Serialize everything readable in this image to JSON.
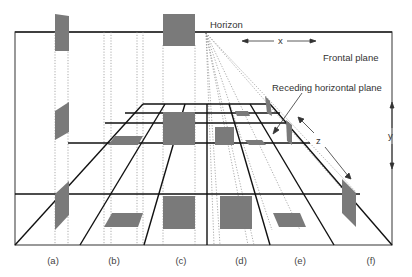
{
  "diagram": {
    "labels": {
      "horizon": "Horizon",
      "frontal_plane": "Frontal plane",
      "receding_plane": "Receding horizontal plane",
      "x_axis": "x",
      "y_axis": "y",
      "z_axis": "z"
    },
    "captions": [
      {
        "id": "a",
        "text": "(a)"
      },
      {
        "id": "b",
        "text": "(b)"
      },
      {
        "id": "c",
        "text": "(c)"
      },
      {
        "id": "d",
        "text": "(d)"
      },
      {
        "id": "e",
        "text": "(e)"
      },
      {
        "id": "f",
        "text": "(f)"
      }
    ],
    "colors": {
      "shape_fill": "#7a7a7a",
      "frame_stroke": "#555555",
      "grid_stroke": "#111111",
      "dotted_stroke": "#888888",
      "text": "#333333"
    }
  }
}
